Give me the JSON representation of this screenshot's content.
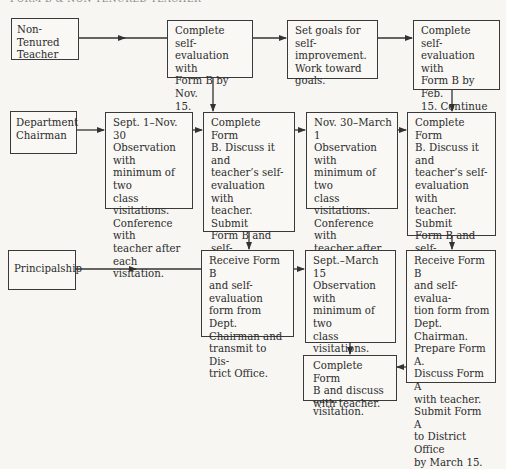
{
  "diagram": {
    "header_text": "FORM B & NON-TENURED TEACHER",
    "roles": [
      {
        "id": "teacher",
        "label": "Non-Tenured\nTeacher"
      },
      {
        "id": "chairman",
        "label": "Department\nChairman"
      },
      {
        "id": "principal",
        "label": "Principalship"
      }
    ],
    "steps": {
      "teacher_1": "Complete self-\nevaluation with\nForm B by Nov.\n15.",
      "teacher_2": "Set goals for self-\nimprovement.\nWork toward\ngoals.",
      "teacher_3": "Complete self-\nevaluation with\nForm B by Feb.\n15. Continue\nimprovement.",
      "chairman_1": "Sept. 1–Nov. 30\nObservation with\nminimum of two\nclass visitations.\nConference with\nteacher after\neach visitation.",
      "chairman_2": "Complete Form\nB. Discuss it and\nteacher’s self-\nevaluation with\nteacher. Submit\nForm B and self-\nevaluation form\nto principalship\nby Nov. 30.",
      "chairman_3": "Nov. 30–March 1\nObservation with\nminimum of two\nclass visitations.\nConference with\nteacher after\neach visitation.",
      "chairman_4": "Complete Form\nB. Discuss it and\nteacher’s self-\nevaluation with\nteacher. Submit\nForm B and self-\nevaluation form\nto principalship\nby March.",
      "principal_1": "Receive Form B\nand self-evaluation\nform from Dept.\nChairman and\ntransmit to Dis-\ntrict Office.",
      "principal_2": "Sept.–March 15\nObservation with\nminimum of two\nclass visitations.\nConference with\nteacher after\neach visitation.",
      "principal_3": "Receive Form B\nand self-evalua-\ntion form from\nDept. Chairman.\nPrepare Form A.\nDiscuss Form A\nwith teacher.\nSubmit Form A\nto District Office\nby March 15.",
      "principal_4": "Complete Form\nB and discuss\nwith teacher."
    },
    "colors": {
      "line": "#333333",
      "background": "#f7f6f3",
      "text": "#2b2b2b"
    }
  }
}
